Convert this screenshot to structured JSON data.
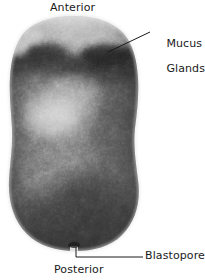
{
  "figure": {
    "kind": "photomicrograph",
    "background_color": "#ffffff",
    "ink_color": "#1a1a1a"
  },
  "labels": {
    "anterior": "Anterior",
    "mucus_glands_line1": "Mucus",
    "mucus_glands_line2": "Glands",
    "blastopore": "Blastopore",
    "posterior": "Posterior"
  },
  "specimen": {
    "outline_fill": "#6b6b6b",
    "apex_fill": "#cfcfcf",
    "dark_band_fill": "#3c3c3c",
    "light_patch_fill": "#b9b9b9",
    "body_fill": "#5a5a5a",
    "bounds": {
      "left": 7,
      "top": 16,
      "right": 141,
      "bottom": 251
    },
    "blastopore_notch_x": 76,
    "blastopore_notch_y": 248
  },
  "leaders": {
    "mucus": {
      "x1": 108,
      "y1": 52,
      "x2": 150,
      "y2": 32
    },
    "blastopore": {
      "x1": 76,
      "y1": 247,
      "x2": 76,
      "y2": 257,
      "x3": 143,
      "y3": 257
    }
  }
}
